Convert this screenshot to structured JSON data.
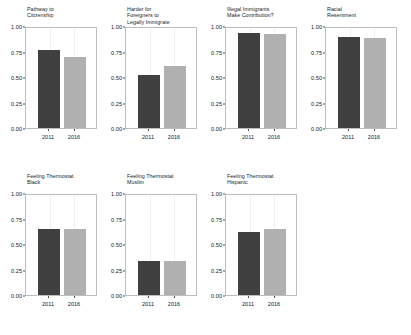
{
  "chart_data": {
    "type": "bar",
    "title": "",
    "xlabel": "",
    "ylabel": "",
    "ylim": [
      0,
      1.0
    ],
    "categories": [
      "2011",
      "2016"
    ],
    "ytick_labels": [
      "0.00",
      "0.25",
      "0.50",
      "0.75",
      "1.00"
    ],
    "ytick_values": [
      0.0,
      0.25,
      0.5,
      0.75,
      1.0
    ],
    "grid": false,
    "legend": "none",
    "colors": {
      "bar_2011": "#404040",
      "bar_2016": "#b0b0b0",
      "panel_background": "#ffffff",
      "panel_border": "#bdbdbd",
      "text": "#1a1a1a"
    },
    "panels": [
      {
        "title": "Pathway to\nCitizenship",
        "values": [
          0.76,
          0.7
        ]
      },
      {
        "title": "Harder for\nForeigners to\nLegally Immigrate",
        "values": [
          0.52,
          0.61
        ]
      },
      {
        "title": "Illegal Immigrants\nMake Contribution?",
        "values": [
          0.93,
          0.92
        ]
      },
      {
        "title": "Racial\nResentment",
        "values": [
          0.89,
          0.88
        ]
      },
      {
        "title": "Feeling Thermostat\nBlack",
        "values": [
          0.65,
          0.65
        ]
      },
      {
        "title": "Feeling Thermostat\nMuslim",
        "values": [
          0.33,
          0.33
        ]
      },
      {
        "title": "Feeling Thermostat\nHispanic",
        "values": [
          0.62,
          0.65
        ]
      }
    ]
  }
}
